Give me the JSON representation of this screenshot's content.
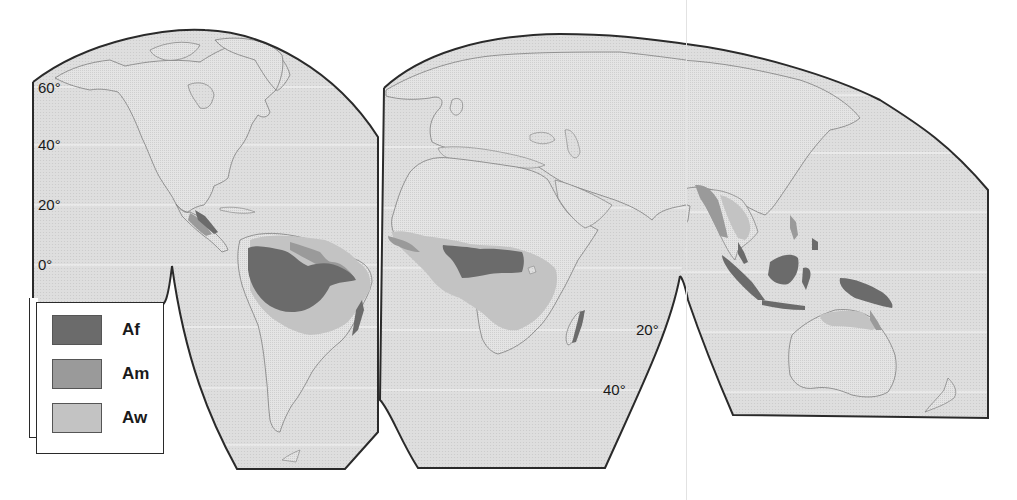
{
  "figure": {
    "title": "",
    "type": "world map of tropical climates (Köppen A group)",
    "projection": "interrupted (three-lobe) projection"
  },
  "colors": {
    "ocean": "#dcdcdc",
    "land": "#e6e6e6",
    "coast": "#7d7d7d",
    "frame": "#2a2a2a",
    "graticule": "#f7f7f7",
    "Af": "#6b6b6b",
    "Am": "#9a9a9a",
    "Aw": "#c3c3c3"
  },
  "latitude_labels": {
    "west": [
      "60°",
      "40°",
      "20°",
      "0°"
    ],
    "africa_south": [
      "20°",
      "40°"
    ]
  },
  "legend": {
    "items": [
      {
        "code": "Af",
        "label": "Af"
      },
      {
        "code": "Am",
        "label": "Am"
      },
      {
        "code": "Aw",
        "label": "Aw"
      }
    ]
  },
  "regions": {
    "Af": [
      "Amazon Basin",
      "Central America (Caribbean side)",
      "Eastern Brazil coast",
      "Congo Basin",
      "Eastern Madagascar",
      "Sumatra",
      "Malay Peninsula",
      "Borneo",
      "Sulawesi",
      "New Guinea",
      "Philippines (Mindanao)"
    ],
    "Am": [
      "Central America",
      "Northern South America",
      "West African coast",
      "Western India coast",
      "Myanmar / Bangladesh",
      "Indochina",
      "Northeastern Australia coast"
    ],
    "Aw": [
      "Venezuela / Guianas",
      "Brazilian Highlands",
      "Sahel belt of West Africa",
      "East & Southern Africa",
      "Western Madagascar",
      "India",
      "Thailand / Cambodia",
      "Northern Australia"
    ]
  }
}
